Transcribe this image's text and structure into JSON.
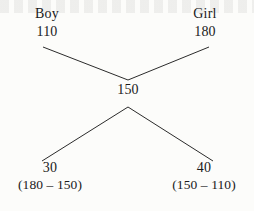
{
  "diagram": {
    "type": "alligation-cross",
    "nodes": {
      "top_left": {
        "header": "Boy",
        "value": "110"
      },
      "top_right": {
        "header": "Girl",
        "value": "180"
      },
      "center": {
        "value": "150"
      },
      "bottom_left": {
        "value": "30",
        "expression": "(180 – 150)"
      },
      "bottom_right": {
        "value": "40",
        "expression": "(150 – 110)"
      }
    },
    "colors": {
      "ink": "#1a1a1a",
      "line": "#2b2b2b",
      "paper": "#fcfcfa"
    }
  }
}
